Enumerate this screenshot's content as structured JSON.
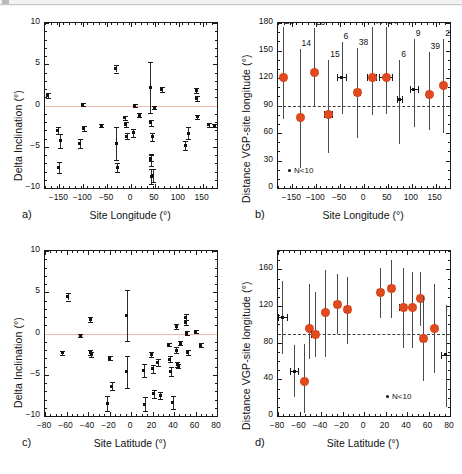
{
  "figure": {
    "panels": [
      {
        "tag": "a)",
        "xlabel": "Site Longitude (°)",
        "ylabel": "Delta Inclination (°)"
      },
      {
        "tag": "b)",
        "xlabel": "Site Longitude (°)",
        "ylabel": "Distance VGP-site longitude (°)"
      },
      {
        "tag": "c)",
        "xlabel": "Site Latitude (°)",
        "ylabel": "Delta Inclination (°)"
      },
      {
        "tag": "d)",
        "xlabel": "Site Latitude (°)",
        "ylabel": "Distance VGP-site longitude (°)"
      }
    ],
    "legend_text": "N<10",
    "colors": {
      "marker_orange": "#e04a1e",
      "marker_black": "#111111",
      "zero_line": "#f2b8a8",
      "dashed_line": "#3b3b3b",
      "axis": "#1a1a1a"
    },
    "caption": ""
  },
  "chart_data": [
    {
      "id": "a",
      "type": "scatter",
      "title": "",
      "xlabel": "Site Longitude (°)",
      "ylabel": "Delta Inclination (°)",
      "xlim": [
        -180,
        180
      ],
      "ylim": [
        -10,
        10
      ],
      "xticks": [
        -150,
        -100,
        -50,
        0,
        50,
        100,
        150
      ],
      "yticks": [
        -10,
        -5,
        0,
        5,
        10
      ],
      "grid": false,
      "reference_line": {
        "y": 0,
        "style": "solid",
        "color": "#f2b8a8"
      },
      "points": [
        {
          "x": -174,
          "y": 1.25,
          "yerr": 0.3
        },
        {
          "x": -153,
          "y": -3.05,
          "yerr": 0.4
        },
        {
          "x": -148,
          "y": -4.25,
          "yerr": 0.85
        },
        {
          "x": -151,
          "y": -7.5,
          "yerr": 0.7
        },
        {
          "x": -107,
          "y": -4.6,
          "yerr": 0.5
        },
        {
          "x": -101,
          "y": 0.15,
          "yerr": 0.2
        },
        {
          "x": -99,
          "y": -2.8,
          "yerr": 0.35
        },
        {
          "x": -62,
          "y": -2.4,
          "yerr": 0.2
        },
        {
          "x": -32,
          "y": 4.45,
          "yerr": 0.45
        },
        {
          "x": -31,
          "y": -4.65,
          "yerr": 2.0
        },
        {
          "x": -29,
          "y": -7.5,
          "yerr": 0.55
        },
        {
          "x": -13,
          "y": -1.5,
          "yerr": 0.2
        },
        {
          "x": -11,
          "y": -2.25,
          "yerr": 0.3
        },
        {
          "x": -9,
          "y": -3.7,
          "yerr": 0.35
        },
        {
          "x": 8,
          "y": 0.0,
          "yerr": 0.15
        },
        {
          "x": 5,
          "y": -3.3,
          "yerr": 0.5
        },
        {
          "x": 17,
          "y": -1.2,
          "yerr": 0.25
        },
        {
          "x": 40,
          "y": 2.2,
          "yerr": 3.1
        },
        {
          "x": 41,
          "y": -2.1,
          "yerr": 0.4
        },
        {
          "x": 44,
          "y": -3.8,
          "yerr": 0.45
        },
        {
          "x": 41,
          "y": -6.6,
          "yerr": 0.75
        },
        {
          "x": 41,
          "y": -6.4,
          "yerr": 0.35
        },
        {
          "x": 42,
          "y": -8.6,
          "yerr": 0.9
        },
        {
          "x": 46,
          "y": -8.5,
          "yerr": 0.8
        },
        {
          "x": 49,
          "y": -0.25,
          "yerr": 0.2
        },
        {
          "x": 64,
          "y": 1.95,
          "yerr": 0.3
        },
        {
          "x": 114,
          "y": -4.85,
          "yerr": 0.6
        },
        {
          "x": 120,
          "y": -3.35,
          "yerr": 0.7
        },
        {
          "x": 137,
          "y": 1.8,
          "yerr": 0.3
        },
        {
          "x": 138,
          "y": 0.8,
          "yerr": 0.3
        },
        {
          "x": 139,
          "y": -1.35,
          "yerr": 0.25
        },
        {
          "x": 163,
          "y": -2.35,
          "yerr": 0.2
        },
        {
          "x": 174,
          "y": -2.45,
          "yerr": 0.2
        }
      ]
    },
    {
      "id": "b",
      "type": "scatter",
      "title": "",
      "xlabel": "Site Longitude (°)",
      "ylabel": "Distance VGP-site longitude (°)",
      "xlim": [
        -180,
        180
      ],
      "ylim": [
        0,
        180
      ],
      "xticks": [
        -150,
        -100,
        -50,
        0,
        50,
        100,
        150
      ],
      "yticks": [
        0,
        30,
        60,
        90,
        120,
        150,
        180
      ],
      "grid": false,
      "reference_line": {
        "y": 90,
        "style": "dashed",
        "color": "#3b3b3b"
      },
      "legend": "N<10",
      "points": [
        {
          "x": -170,
          "y": 121,
          "n": 28,
          "big": true,
          "ylo": 75,
          "yhi": 176,
          "xerr": 0
        },
        {
          "x": -135,
          "y": 77,
          "n": 14,
          "big": true,
          "ylo": 22,
          "yhi": 152,
          "xerr": 0
        },
        {
          "x": -105,
          "y": 127,
          "n": 28,
          "big": true,
          "ylo": 88,
          "yhi": 175,
          "xerr": 0
        },
        {
          "x": -75,
          "y": 81,
          "n": 15,
          "big": true,
          "ylo": 38,
          "yhi": 140,
          "xerr": 8
        },
        {
          "x": -47,
          "y": 121,
          "n": 6,
          "big": false,
          "ylo": 81,
          "yhi": 159,
          "xerr": 10
        },
        {
          "x": -15,
          "y": 105,
          "n": 38,
          "big": true,
          "ylo": 55,
          "yhi": 153,
          "xerr": 6
        },
        {
          "x": 16,
          "y": 121,
          "n": 44,
          "big": true,
          "ylo": 80,
          "yhi": 176,
          "xerr": 10
        },
        {
          "x": 45,
          "y": 121,
          "n": 94,
          "big": true,
          "ylo": 81,
          "yhi": 176,
          "xerr": 13
        },
        {
          "x": 74,
          "y": 97,
          "n": 6,
          "big": false,
          "ylo": 48,
          "yhi": 140,
          "xerr": 5
        },
        {
          "x": 104,
          "y": 108,
          "n": 9,
          "big": false,
          "ylo": 66,
          "yhi": 163,
          "xerr": 8
        },
        {
          "x": 135,
          "y": 103,
          "n": 39,
          "big": true,
          "ylo": 63,
          "yhi": 148,
          "xerr": 6
        },
        {
          "x": 166,
          "y": 112,
          "n": 29,
          "big": true,
          "ylo": 60,
          "yhi": 163,
          "xerr": 0
        }
      ]
    },
    {
      "id": "c",
      "type": "scatter",
      "title": "",
      "xlabel": "Site Latitude (°)",
      "ylabel": "Delta Inclination (°)",
      "xlim": [
        -80,
        80
      ],
      "ylim": [
        -10,
        10
      ],
      "xticks": [
        -80,
        -60,
        -40,
        -20,
        0,
        20,
        40,
        60,
        80
      ],
      "yticks": [
        -10,
        -5,
        0,
        5,
        10
      ],
      "grid": false,
      "reference_line": {
        "y": 0,
        "style": "solid",
        "color": "#f2b8a8"
      },
      "points": [
        {
          "x": -64,
          "y": -2.35,
          "yerr": 0.2
        },
        {
          "x": -59,
          "y": 4.45,
          "yerr": 0.45
        },
        {
          "x": -47,
          "y": -0.25,
          "yerr": 0.2
        },
        {
          "x": -38,
          "y": 1.75,
          "yerr": 0.3
        },
        {
          "x": -38,
          "y": -2.3,
          "yerr": 0.35
        },
        {
          "x": -37,
          "y": -2.55,
          "yerr": 0.25
        },
        {
          "x": -22,
          "y": -8.5,
          "yerr": 0.9
        },
        {
          "x": -20,
          "y": -3.0,
          "yerr": 0.25
        },
        {
          "x": -18,
          "y": -6.4,
          "yerr": 0.5
        },
        {
          "x": -4,
          "y": 2.2,
          "yerr": 3.1
        },
        {
          "x": -4,
          "y": -4.65,
          "yerr": 1.9
        },
        {
          "x": 12,
          "y": -4.5,
          "yerr": 0.8
        },
        {
          "x": 13,
          "y": -8.55,
          "yerr": 0.9
        },
        {
          "x": 19,
          "y": -2.5,
          "yerr": 0.3
        },
        {
          "x": 20,
          "y": -4.3,
          "yerr": 0.5
        },
        {
          "x": 21,
          "y": -7.3,
          "yerr": 0.5
        },
        {
          "x": 25,
          "y": -3.5,
          "yerr": 0.45
        },
        {
          "x": 27,
          "y": -7.5,
          "yerr": 0.45
        },
        {
          "x": 35,
          "y": -1.3,
          "yerr": 0.2
        },
        {
          "x": 36,
          "y": -3.1,
          "yerr": 0.4
        },
        {
          "x": 37,
          "y": -4.6,
          "yerr": 0.5
        },
        {
          "x": 39,
          "y": -8.4,
          "yerr": 0.8
        },
        {
          "x": 42,
          "y": 0.8,
          "yerr": 0.3
        },
        {
          "x": 42,
          "y": -2.0,
          "yerr": 0.35
        },
        {
          "x": 43,
          "y": -3.8,
          "yerr": 0.3
        },
        {
          "x": 44,
          "y": -3.95,
          "yerr": 0.25
        },
        {
          "x": 46,
          "y": -1.2,
          "yerr": 0.25
        },
        {
          "x": 51,
          "y": 2.0,
          "yerr": 0.35
        },
        {
          "x": 51,
          "y": 1.35,
          "yerr": 0.3
        },
        {
          "x": 52,
          "y": 0.05,
          "yerr": 0.2
        },
        {
          "x": 53,
          "y": -2.3,
          "yerr": 0.25
        },
        {
          "x": 60,
          "y": 0.25,
          "yerr": 0.2
        },
        {
          "x": 65,
          "y": -1.4,
          "yerr": 0.2
        }
      ]
    },
    {
      "id": "d",
      "type": "scatter",
      "title": "",
      "xlabel": "Site Latitude (°)",
      "ylabel": "Distance VGP-site longitude (°)",
      "xlim": [
        -80,
        80
      ],
      "ylim": [
        0,
        180
      ],
      "xticks": [
        -80,
        -60,
        -40,
        -20,
        0,
        20,
        40,
        60,
        80
      ],
      "yticks": [
        0,
        40,
        80,
        120,
        160
      ],
      "grid": false,
      "reference_line": {
        "y": 90,
        "style": "dashed",
        "color": "#3b3b3b"
      },
      "legend": "N<10",
      "points": [
        {
          "x": -76,
          "y": 108,
          "big": false,
          "ylo": 68,
          "yhi": 147,
          "xerr": 4
        },
        {
          "x": -65,
          "y": 49,
          "big": false,
          "ylo": 21,
          "yhi": 78,
          "xerr": 4
        },
        {
          "x": -56,
          "y": 38,
          "big": true,
          "ylo": 3,
          "yhi": 79,
          "xerr": 0
        },
        {
          "x": -51,
          "y": 96,
          "big": true,
          "ylo": 62,
          "yhi": 144,
          "xerr": 0
        },
        {
          "x": -46,
          "y": 90,
          "big": true,
          "ylo": 64,
          "yhi": 135,
          "xerr": 3
        },
        {
          "x": -36,
          "y": 114,
          "big": true,
          "ylo": 64,
          "yhi": 159,
          "xerr": 0
        },
        {
          "x": -25,
          "y": 122,
          "big": true,
          "ylo": 89,
          "yhi": 155,
          "xerr": 3
        },
        {
          "x": -16,
          "y": 117,
          "big": true,
          "ylo": 79,
          "yhi": 152,
          "xerr": 3
        },
        {
          "x": 15,
          "y": 135,
          "big": true,
          "ylo": 107,
          "yhi": 162,
          "xerr": 3
        },
        {
          "x": 25,
          "y": 140,
          "big": true,
          "ylo": 107,
          "yhi": 170,
          "xerr": 3
        },
        {
          "x": 36,
          "y": 119,
          "big": true,
          "ylo": 74,
          "yhi": 162,
          "xerr": 3
        },
        {
          "x": 45,
          "y": 119,
          "big": true,
          "ylo": 74,
          "yhi": 157,
          "xerr": 0
        },
        {
          "x": 52,
          "y": 129,
          "big": true,
          "ylo": 98,
          "yhi": 157,
          "xerr": 0
        },
        {
          "x": 55,
          "y": 85,
          "big": true,
          "ylo": 38,
          "yhi": 131,
          "xerr": 3
        },
        {
          "x": 65,
          "y": 96,
          "big": true,
          "ylo": 47,
          "yhi": 144,
          "xerr": 0
        },
        {
          "x": 76,
          "y": 67,
          "big": false,
          "ylo": 10,
          "yhi": 121,
          "xerr": 4
        }
      ]
    }
  ]
}
